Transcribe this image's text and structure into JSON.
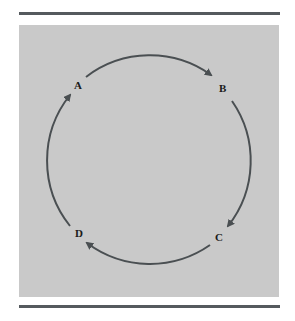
{
  "diagram": {
    "type": "cycle",
    "nodes": [
      {
        "id": "A",
        "label": "A"
      },
      {
        "id": "B",
        "label": "B"
      },
      {
        "id": "C",
        "label": "C"
      },
      {
        "id": "D",
        "label": "D"
      }
    ],
    "edges": [
      {
        "from": "A",
        "to": "B"
      },
      {
        "from": "B",
        "to": "C"
      },
      {
        "from": "C",
        "to": "D"
      },
      {
        "from": "D",
        "to": "A"
      }
    ],
    "direction": "clockwise"
  },
  "colors": {
    "panel": "#c9c9c9",
    "rule": "#555a5e",
    "arrow": "#4a4f52",
    "label": "#1a1a1a"
  }
}
